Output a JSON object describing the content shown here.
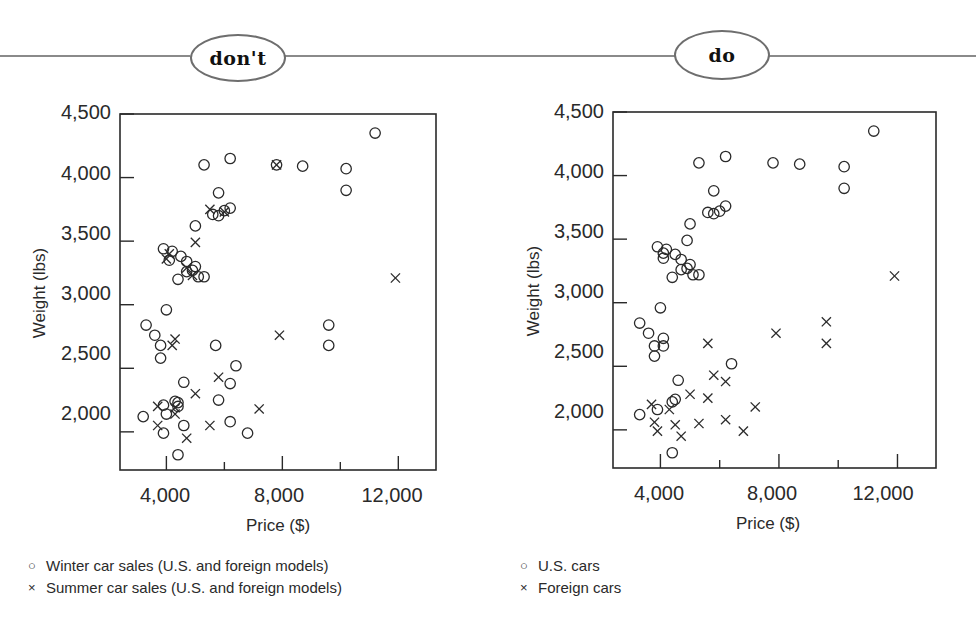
{
  "header": {
    "left_badge": "don't",
    "right_badge": "do"
  },
  "chart_data": [
    {
      "type": "scatter",
      "panel": "don't",
      "title": "",
      "xlabel": "Price ($)",
      "ylabel": "Weight (lbs)",
      "xlim": [
        2400,
        13300
      ],
      "ylim": [
        1700,
        4500
      ],
      "xticks": [
        4000,
        8000,
        12000
      ],
      "xticks_minor": [
        6000,
        10000
      ],
      "xtick_labels": [
        "4,000",
        "8,000",
        "12,000"
      ],
      "yticks": [
        2000,
        2500,
        3000,
        3500,
        4000,
        4500
      ],
      "ytick_labels": [
        "2,000",
        "2,500",
        "3,000",
        "3,500",
        "4,000",
        "4,500"
      ],
      "grid": false,
      "legend_position": "below",
      "series": [
        {
          "name": "Winter car sales (U.S. and foreign models)",
          "marker": "circle",
          "points": [
            [
              11200,
              4350
            ],
            [
              6200,
              4150
            ],
            [
              5300,
              4100
            ],
            [
              7800,
              4100
            ],
            [
              8700,
              4090
            ],
            [
              10200,
              4070
            ],
            [
              10200,
              3900
            ],
            [
              5800,
              3880
            ],
            [
              5600,
              3710
            ],
            [
              5800,
              3700
            ],
            [
              6000,
              3740
            ],
            [
              6200,
              3760
            ],
            [
              5000,
              3620
            ],
            [
              3900,
              3440
            ],
            [
              4200,
              3420
            ],
            [
              4500,
              3380
            ],
            [
              4700,
              3340
            ],
            [
              4700,
              3260
            ],
            [
              5000,
              3300
            ],
            [
              4100,
              3350
            ],
            [
              4400,
              3200
            ],
            [
              5100,
              3220
            ],
            [
              5300,
              3220
            ],
            [
              4900,
              3270
            ],
            [
              4000,
              2960
            ],
            [
              3300,
              2840
            ],
            [
              3600,
              2760
            ],
            [
              3800,
              2680
            ],
            [
              3800,
              2580
            ],
            [
              5700,
              2680
            ],
            [
              9600,
              2840
            ],
            [
              9600,
              2680
            ],
            [
              6400,
              2520
            ],
            [
              4600,
              2390
            ],
            [
              6200,
              2380
            ],
            [
              3200,
              2120
            ],
            [
              3900,
              2210
            ],
            [
              4300,
              2240
            ],
            [
              4400,
              2230
            ],
            [
              4400,
              2200
            ],
            [
              5800,
              2250
            ],
            [
              4000,
              2140
            ],
            [
              4600,
              2050
            ],
            [
              6200,
              2080
            ],
            [
              6800,
              1990
            ],
            [
              3900,
              1990
            ],
            [
              4400,
              1820
            ]
          ]
        },
        {
          "name": "Summer car sales (U.S. and foreign models)",
          "marker": "x",
          "points": [
            [
              7800,
              4100
            ],
            [
              5500,
              3750
            ],
            [
              6000,
              3730
            ],
            [
              5000,
              3490
            ],
            [
              4100,
              3400
            ],
            [
              4000,
              3360
            ],
            [
              4700,
              3290
            ],
            [
              4900,
              3230
            ],
            [
              11900,
              3210
            ],
            [
              7900,
              2760
            ],
            [
              4300,
              2730
            ],
            [
              4200,
              2680
            ],
            [
              5800,
              2430
            ],
            [
              5000,
              2300
            ],
            [
              7200,
              2180
            ],
            [
              3700,
              2200
            ],
            [
              4300,
              2190
            ],
            [
              4300,
              2140
            ],
            [
              3700,
              2050
            ],
            [
              5500,
              2050
            ],
            [
              4700,
              1950
            ]
          ]
        }
      ]
    },
    {
      "type": "scatter",
      "panel": "do",
      "title": "",
      "xlabel": "Price ($)",
      "ylabel": "Weight (lbs)",
      "xlim": [
        2400,
        13300
      ],
      "ylim": [
        1700,
        4500
      ],
      "xticks": [
        4000,
        8000,
        12000
      ],
      "xticks_minor": [
        6000,
        10000
      ],
      "xtick_labels": [
        "4,000",
        "8,000",
        "12,000"
      ],
      "yticks": [
        2000,
        2500,
        3000,
        3500,
        4000,
        4500
      ],
      "ytick_labels": [
        "2,000",
        "2,500",
        "3,000",
        "3,500",
        "4,000",
        "4,500"
      ],
      "grid": false,
      "legend_position": "below",
      "series": [
        {
          "name": "U.S. cars",
          "marker": "circle",
          "points": [
            [
              11200,
              4350
            ],
            [
              6200,
              4150
            ],
            [
              5300,
              4100
            ],
            [
              7800,
              4100
            ],
            [
              8700,
              4090
            ],
            [
              10200,
              4070
            ],
            [
              10200,
              3900
            ],
            [
              5800,
              3880
            ],
            [
              5600,
              3710
            ],
            [
              5800,
              3700
            ],
            [
              6000,
              3720
            ],
            [
              6200,
              3760
            ],
            [
              5000,
              3620
            ],
            [
              4900,
              3490
            ],
            [
              3900,
              3440
            ],
            [
              4200,
              3420
            ],
            [
              4500,
              3380
            ],
            [
              4700,
              3340
            ],
            [
              4700,
              3260
            ],
            [
              5000,
              3300
            ],
            [
              4100,
              3350
            ],
            [
              4400,
              3200
            ],
            [
              5100,
              3220
            ],
            [
              5300,
              3220
            ],
            [
              4900,
              3270
            ],
            [
              4100,
              3390
            ],
            [
              4000,
              2960
            ],
            [
              3300,
              2840
            ],
            [
              3600,
              2760
            ],
            [
              4100,
              2720
            ],
            [
              3800,
              2660
            ],
            [
              4100,
              2660
            ],
            [
              3800,
              2580
            ],
            [
              6400,
              2520
            ],
            [
              4600,
              2390
            ],
            [
              4400,
              2220
            ],
            [
              4500,
              2240
            ],
            [
              3300,
              2120
            ],
            [
              3900,
              2160
            ],
            [
              4400,
              1820
            ]
          ]
        },
        {
          "name": "Foreign cars",
          "marker": "x",
          "points": [
            [
              11900,
              3210
            ],
            [
              9600,
              2850
            ],
            [
              7900,
              2760
            ],
            [
              9600,
              2680
            ],
            [
              5600,
              2680
            ],
            [
              5800,
              2430
            ],
            [
              6200,
              2380
            ],
            [
              5000,
              2280
            ],
            [
              5600,
              2250
            ],
            [
              7200,
              2180
            ],
            [
              3700,
              2200
            ],
            [
              4300,
              2160
            ],
            [
              3800,
              2060
            ],
            [
              6200,
              2080
            ],
            [
              5300,
              2050
            ],
            [
              4500,
              2040
            ],
            [
              3900,
              1990
            ],
            [
              6800,
              1990
            ],
            [
              4700,
              1950
            ]
          ]
        }
      ]
    }
  ],
  "left_legend": {
    "items": [
      {
        "symbol": "○",
        "label": "Winter car sales (U.S. and foreign models)"
      },
      {
        "symbol": "×",
        "label": "Summer car sales (U.S. and foreign models)"
      }
    ]
  },
  "right_legend": {
    "items": [
      {
        "symbol": "○",
        "label": "U.S. cars"
      },
      {
        "symbol": "×",
        "label": "Foreign cars"
      }
    ]
  },
  "colors": {
    "ink": "#2a2a2a",
    "rule": "#8a8a8a",
    "badge_border": "#6e6e6e",
    "background": "#ffffff"
  }
}
